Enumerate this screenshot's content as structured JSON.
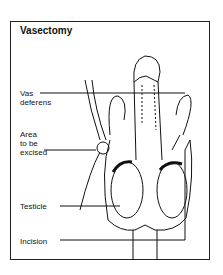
{
  "title": "Vasectomy",
  "labels": {
    "vas_deferens": [
      "Vas",
      "deferens"
    ],
    "area": [
      "Area",
      "to be",
      "excised"
    ],
    "testicle": "Testicle",
    "incision": "Incision"
  }
}
